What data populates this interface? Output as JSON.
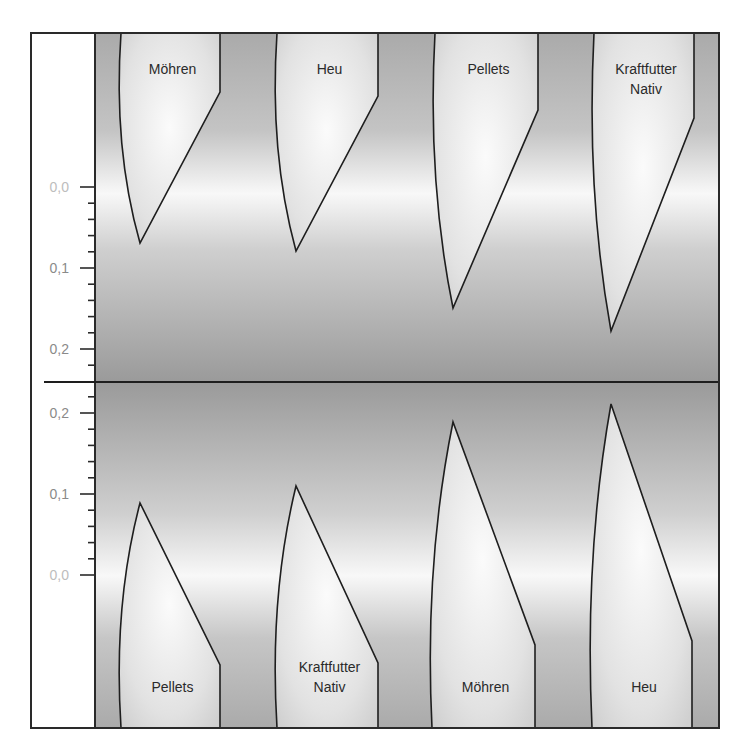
{
  "chart_data": {
    "type": "diagram-violin-like",
    "title": "",
    "colors": {
      "frame": "#2a2a2a",
      "outline": "#1e1e1e",
      "bg_dark": "#9a9a9a",
      "bg_mid": "#b4b4b4",
      "bg_light": "#f7f7f7",
      "shape_light": "#fafafa",
      "shape_mid": "#d8d8d8",
      "tick_label": "#8a8a8a",
      "zero_label": "#bdbdbd"
    },
    "panels": [
      {
        "name": "top",
        "axis": {
          "ticks": [
            {
              "label": "0,0",
              "value": 0.0,
              "y": 187
            },
            {
              "label": "0,1",
              "value": 0.1,
              "y": 268
            },
            {
              "label": "0,2",
              "value": 0.2,
              "y": 349
            }
          ],
          "minor_step_px": 16.2,
          "direction": "down"
        },
        "series": [
          {
            "label": "Möhren",
            "label_lines": [
              "Möhren"
            ],
            "x_left": 121,
            "x_right": 220,
            "corner_y": 92,
            "tip_x": 140,
            "tip_y": 243,
            "tip_value": 0.07
          },
          {
            "label": "Heu",
            "label_lines": [
              "Heu"
            ],
            "x_left": 277,
            "x_right": 378,
            "corner_y": 96,
            "tip_x": 296,
            "tip_y": 251,
            "tip_value": 0.08
          },
          {
            "label": "Pellets",
            "label_lines": [
              "Pellets"
            ],
            "x_left": 435,
            "x_right": 538,
            "corner_y": 110,
            "tip_x": 453,
            "tip_y": 308,
            "tip_value": 0.15
          },
          {
            "label": "Kraftfutter Nativ",
            "label_lines": [
              "Kraftfutter",
              "Nativ"
            ],
            "x_left": 594,
            "x_right": 694,
            "corner_y": 118,
            "tip_x": 611,
            "tip_y": 331,
            "tip_value": 0.18
          }
        ]
      },
      {
        "name": "bottom",
        "axis": {
          "ticks": [
            {
              "label": "0,2",
              "value": 0.2,
              "y": 413
            },
            {
              "label": "0,1",
              "value": 0.1,
              "y": 494
            },
            {
              "label": "0,0",
              "value": 0.0,
              "y": 575
            }
          ],
          "minor_step_px": 16.2,
          "direction": "up"
        },
        "series": [
          {
            "label": "Pellets",
            "label_lines": [
              "Pellets"
            ],
            "x_left": 121,
            "x_right": 220,
            "corner_y": 665,
            "tip_x": 140,
            "tip_y": 503,
            "tip_value": 0.09
          },
          {
            "label": "Kraftfutter Nativ",
            "label_lines": [
              "Kraftfutter",
              "Nativ"
            ],
            "x_left": 277,
            "x_right": 378,
            "corner_y": 663,
            "tip_x": 296,
            "tip_y": 486,
            "tip_value": 0.11
          },
          {
            "label": "Möhren",
            "label_lines": [
              "Möhren"
            ],
            "x_left": 432,
            "x_right": 535,
            "corner_y": 645,
            "tip_x": 453,
            "tip_y": 422,
            "tip_value": 0.19
          },
          {
            "label": "Heu",
            "label_lines": [
              "Heu"
            ],
            "x_left": 592,
            "x_right": 692,
            "corner_y": 641,
            "tip_x": 611,
            "tip_y": 404,
            "tip_value": 0.21
          }
        ]
      }
    ],
    "layout": {
      "frame": {
        "x": 31,
        "y": 33,
        "w": 688,
        "h": 695
      },
      "axis_panel_right": 95,
      "divider_y": 382,
      "divider_x_start": 44,
      "top_label_y": 74,
      "bottom_label_y": 692
    }
  }
}
